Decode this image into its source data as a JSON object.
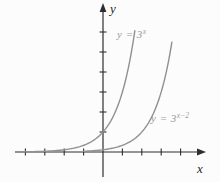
{
  "figure": {
    "colors": {
      "background": "#fcfcfc",
      "axis": "#2e2e2e",
      "curve": "#909090",
      "curve_label": "#9a9a9a",
      "axis_label": "#1f1f1f"
    }
  },
  "labels": {
    "y_axis": "y",
    "x_axis": "x",
    "curve1": {
      "prefix": "y = 3",
      "sup": "x"
    },
    "curve2": {
      "prefix": "y = 3",
      "sup": "x−2"
    }
  },
  "chart_data": {
    "type": "line",
    "title": "",
    "xlabel": "x",
    "ylabel": "y",
    "grid": false,
    "tick_labels_shown": false,
    "xlim": [
      -4.6,
      5.3
    ],
    "ylim": [
      -1.5,
      7.45
    ],
    "x_ticks": [
      -4,
      -3,
      -2,
      -1,
      1,
      2,
      3,
      4
    ],
    "y_ticks": [
      1,
      2,
      3,
      4,
      5,
      6
    ],
    "series": [
      {
        "name": "y = 3^x",
        "expression": "y = 3^x",
        "base": 3,
        "x_shift": 0,
        "x_start": -4.5,
        "x_end": 1.64,
        "key_points": [
          [
            -2,
            0.111
          ],
          [
            -1,
            0.333
          ],
          [
            0,
            1
          ],
          [
            1,
            3
          ],
          [
            1.64,
            6.07
          ]
        ]
      },
      {
        "name": "y = 3^(x-2)",
        "expression": "y = 3^(x-2)",
        "base": 3,
        "x_shift": 2,
        "x_start": -1.0,
        "x_end": 3.55,
        "key_points": [
          [
            0,
            0.111
          ],
          [
            1,
            0.333
          ],
          [
            2,
            1
          ],
          [
            3,
            3
          ],
          [
            3.55,
            5.49
          ]
        ]
      }
    ],
    "annotations": [
      {
        "text": "y = 3^x",
        "x": 1.1,
        "y": 6.0
      },
      {
        "text": "y = 3^(x-2)",
        "x": 3.1,
        "y": 1.8
      }
    ]
  }
}
